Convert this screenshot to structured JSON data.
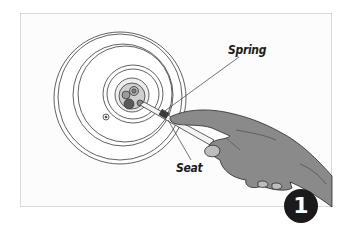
{
  "figure": {
    "type": "instructional-illustration",
    "labels": {
      "spring": "Spring",
      "seat": "Seat"
    },
    "step_number": "1"
  },
  "colors": {
    "panel_border": "#d8d8d8",
    "line_art": "#3a3a3a",
    "hand_fill": "#8a8a8a",
    "handle_fill": "#2c2c2c",
    "badge_fill": "#1a1a1a",
    "badge_text": "#ffffff"
  }
}
